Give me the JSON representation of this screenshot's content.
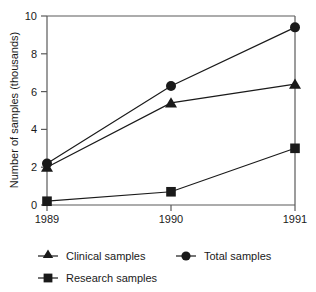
{
  "chart_data": {
    "type": "line",
    "title": "",
    "xlabel": "",
    "ylabel": "Number of samples (thousands)",
    "categories": [
      "1989",
      "1990",
      "1991"
    ],
    "x": [
      1989,
      1990,
      1991
    ],
    "xlim": [
      1989,
      1991
    ],
    "ylim": [
      0,
      10
    ],
    "yticks": [
      0,
      2,
      4,
      6,
      8,
      10
    ],
    "ytick_labels": [
      "0",
      "2",
      "4",
      "6",
      "8",
      "10"
    ],
    "xtick_labels": [
      "1989",
      "1990",
      "1991"
    ],
    "grid": false,
    "legend_position": "below",
    "series": [
      {
        "name": "Clinical samples",
        "marker": "triangle",
        "color": "#1a1a1a",
        "values": [
          2.0,
          5.4,
          6.4
        ]
      },
      {
        "name": "Total samples",
        "marker": "circle",
        "color": "#1a1a1a",
        "values": [
          2.2,
          6.3,
          9.4
        ]
      },
      {
        "name": "Research samples",
        "marker": "square",
        "color": "#1a1a1a",
        "values": [
          0.2,
          0.7,
          3.0
        ]
      }
    ]
  },
  "axis": {
    "y_title": "Number of samples (thousands)",
    "y_ticks": [
      "10",
      "8",
      "6",
      "4",
      "2",
      "0"
    ],
    "x_ticks": [
      "1989",
      "1990",
      "1991"
    ]
  },
  "legend": {
    "entries": [
      {
        "label": "Clinical samples",
        "marker": "triangle-marker-icon"
      },
      {
        "label": "Total samples",
        "marker": "circle-marker-icon"
      },
      {
        "label": "Research samples",
        "marker": "square-marker-icon"
      }
    ]
  },
  "colors": {
    "ink": "#1a1a1a",
    "axis": "#4a4a4a",
    "background": "#ffffff"
  }
}
